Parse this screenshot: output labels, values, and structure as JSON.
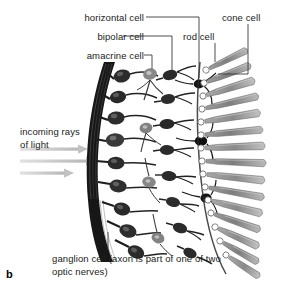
{
  "figure": {
    "letter": "b"
  },
  "labels": {
    "horizontal_cell": "horizontal cell",
    "bipolar_cell": "bipolar cell",
    "amacrine_cell": "amacrine cell",
    "rod_cell": "rod cell",
    "cone_cell": "cone cell",
    "incoming_light": "incoming rays of light",
    "ganglion_cell": "ganglion cell (axon is part of one of two optic nerves)"
  },
  "colors": {
    "text": "#222222",
    "leader_line": "#3a3a3a",
    "nerve_fiber_band": "#161616",
    "cell_body_dark": "#2a2a2a",
    "cell_body_mid": "#555555",
    "photoreceptor_gray": "#8d8d8d",
    "photoreceptor_light": "#b5b5b5",
    "light_arrow": "#c9c9c9",
    "background": "#ffffff"
  },
  "diagram": {
    "light_arrow_count": 3,
    "photoreceptor_rows": 14,
    "layers": [
      "nerve fibre band",
      "ganglion cell layer",
      "inner plexiform layer",
      "bipolar cell layer",
      "outer plexiform layer",
      "photoreceptor layer"
    ]
  }
}
